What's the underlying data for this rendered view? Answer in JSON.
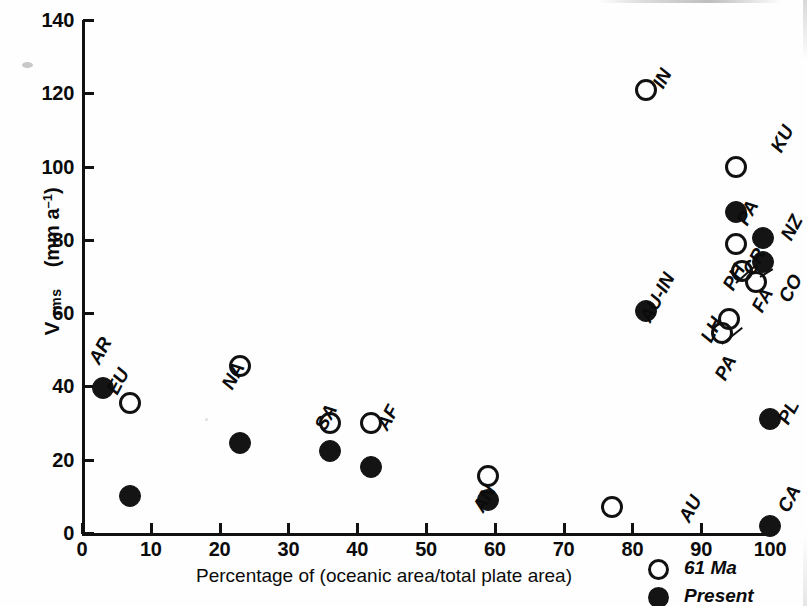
{
  "chart_data": {
    "type": "scatter",
    "title": "",
    "xlabel": "Percentage of (oceanic area/total plate area)",
    "ylabel": "V rms (mm a⁻¹)",
    "ylabel_main": "V",
    "ylabel_sub": "rms",
    "ylabel_unit_prefix": "(mm a",
    "ylabel_unit_exp": "–1",
    "ylabel_unit_suffix": ")",
    "xlim": [
      0,
      100
    ],
    "ylim": [
      0,
      140
    ],
    "xticks": [
      0,
      10,
      20,
      30,
      40,
      50,
      60,
      70,
      80,
      90,
      100
    ],
    "yticks": [
      0,
      20,
      40,
      60,
      80,
      100,
      120,
      140
    ],
    "grid": false,
    "legend_position": "bottom-right",
    "series": [
      {
        "name": "61 Ma",
        "marker": "open-circle",
        "color": "#111111",
        "points": [
          {
            "label": "EU",
            "x": 7,
            "y": 35.5
          },
          {
            "label": "NA",
            "x": 23,
            "y": 45.5
          },
          {
            "label": "SA",
            "x": 36,
            "y": 30.0
          },
          {
            "label": "AF",
            "x": 42,
            "y": 30.0
          },
          {
            "label": "AN",
            "x": 59,
            "y": 15.5
          },
          {
            "label": "AU",
            "x": 77,
            "y": 7.0
          },
          {
            "label": "IN",
            "x": 82,
            "y": 121.0
          },
          {
            "label": "KU",
            "x": 95,
            "y": 100.0
          },
          {
            "label": "CR",
            "x": 95,
            "y": 79.0
          },
          {
            "label": "PH",
            "x": 96,
            "y": 71.5
          },
          {
            "label": "FA",
            "x": 98,
            "y": 68.5
          },
          {
            "label": "LH",
            "x": 94,
            "y": 58.5
          },
          {
            "label": "PA",
            "x": 93,
            "y": 54.5
          }
        ]
      },
      {
        "name": "Present",
        "marker": "filled-circle",
        "color": "#141414",
        "points": [
          {
            "label": "AR",
            "x": 3,
            "y": 39.5
          },
          {
            "label": "EU",
            "x": 7,
            "y": 10.0
          },
          {
            "label": "NA",
            "x": 23,
            "y": 24.5
          },
          {
            "label": "SA",
            "x": 36,
            "y": 22.5
          },
          {
            "label": "AF",
            "x": 42,
            "y": 18.0
          },
          {
            "label": "AN",
            "x": 59,
            "y": 9.0
          },
          {
            "label": "AU-IN",
            "x": 82,
            "y": 60.5
          },
          {
            "label": "PA",
            "x": 95,
            "y": 87.5
          },
          {
            "label": "NZ",
            "x": 99,
            "y": 80.5
          },
          {
            "label": "CO",
            "x": 99,
            "y": 74.0
          },
          {
            "label": "PL",
            "x": 100,
            "y": 31.0
          },
          {
            "label": "CA",
            "x": 100,
            "y": 2.0
          }
        ]
      }
    ],
    "annotations": [
      {
        "text": "AR",
        "near": "AR filled point"
      },
      {
        "text": "EU",
        "near": "EU open point"
      },
      {
        "text": "NA",
        "near": "NA open point"
      },
      {
        "text": "SA",
        "near": "SA open point"
      },
      {
        "text": "AF",
        "near": "AF open point"
      },
      {
        "text": "AN",
        "near": "AN open point"
      },
      {
        "text": "AU",
        "near": "AU open point"
      },
      {
        "text": "IN",
        "near": "IN open point"
      },
      {
        "text": "AU-IN",
        "near": "AU-IN filled point"
      },
      {
        "text": "KU",
        "near": "KU open point"
      },
      {
        "text": "PA",
        "near": "PA filled point"
      },
      {
        "text": "NZ",
        "near": "NZ filled point"
      },
      {
        "text": "CO",
        "near": "CO filled point"
      },
      {
        "text": "CR",
        "near": "CR open point"
      },
      {
        "text": "PH",
        "near": "PH open point"
      },
      {
        "text": "FA",
        "near": "FA open point"
      },
      {
        "text": "LH",
        "near": "LH open point"
      },
      {
        "text": "PA",
        "near": "PA open point"
      },
      {
        "text": "PL",
        "near": "PL filled point"
      },
      {
        "text": "CA",
        "near": "CA filled point"
      }
    ]
  },
  "axes": {
    "y_ticks": [
      "0",
      "20",
      "40",
      "60",
      "80",
      "100",
      "120",
      "140"
    ],
    "x_ticks": [
      "0",
      "10",
      "20",
      "30",
      "40",
      "50",
      "60",
      "70",
      "80",
      "90",
      "100"
    ],
    "x_title": "Percentage of (oceanic area/total plate area)",
    "y_title_main": "V",
    "y_title_sub": "rms",
    "y_unit": "(mm a",
    "y_unit_exp": "–1",
    "y_unit_close": ")"
  },
  "legend": {
    "items": [
      {
        "label": "61 Ma",
        "marker": "open-circle"
      },
      {
        "label": "Present",
        "marker": "filled-circle"
      }
    ]
  }
}
